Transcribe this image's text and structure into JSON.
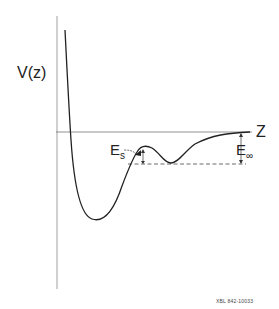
{
  "diagram": {
    "y_axis_label": "V(z)",
    "x_axis_label": "Z",
    "annotations": {
      "surface_barrier": {
        "main": "E",
        "sub": "s"
      },
      "desorption_energy": {
        "main": "E",
        "sub": "∞"
      }
    },
    "footer_code": "XBL 842-10033"
  },
  "colors": {
    "curve": "#222222",
    "axis": "#777777",
    "background": "#ffffff"
  }
}
